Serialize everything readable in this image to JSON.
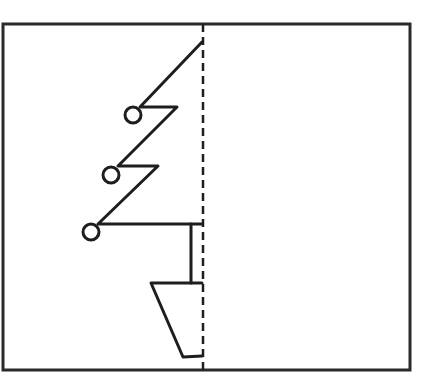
{
  "diagram": {
    "colors": {
      "background": "#ffffff",
      "stroke": "#1e1e1e",
      "frame": "#2a2a2a"
    },
    "frame": {
      "x": 3,
      "y": 24,
      "width": 407,
      "height": 346
    },
    "symmetry_line": {
      "x": 203,
      "y1": 24,
      "y2": 370,
      "style": "dashed"
    },
    "tree_outline_points": [
      [
        202,
        42
      ],
      [
        140,
        107
      ],
      [
        177,
        107
      ],
      [
        118,
        166
      ],
      [
        158,
        166
      ],
      [
        98,
        224
      ],
      [
        202,
        224
      ]
    ],
    "ornaments": [
      {
        "cx": 133,
        "cy": 115,
        "r": 8
      },
      {
        "cx": 111,
        "cy": 175,
        "r": 8
      },
      {
        "cx": 91,
        "cy": 232,
        "r": 8
      }
    ],
    "trunk": {
      "x": 191,
      "y1": 224,
      "y2": 283
    },
    "pot_points": [
      [
        202,
        283
      ],
      [
        151,
        283
      ],
      [
        183,
        357
      ],
      [
        202,
        356
      ]
    ]
  }
}
